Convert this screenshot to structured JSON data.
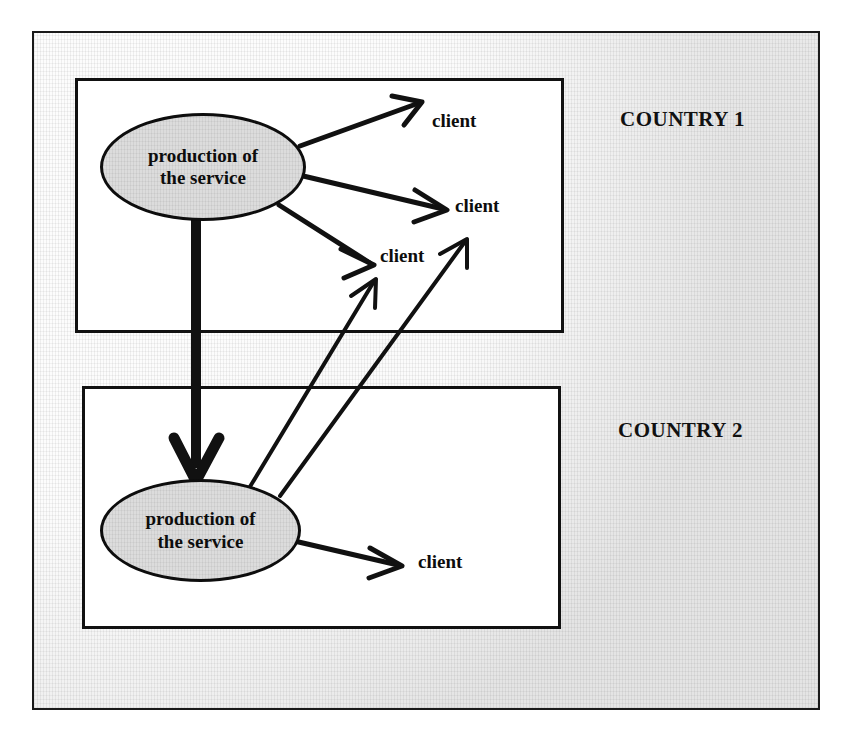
{
  "figure": {
    "background_color": "#ececec",
    "frame_color": "#1a1a1a",
    "node_fill_color": "#dcdcdc",
    "node_stroke_color": "#0d0d0d",
    "edge_color": "#111111"
  },
  "countries": [
    {
      "id": "country-1",
      "label": "COUNTRY 1"
    },
    {
      "id": "country-2",
      "label": "COUNTRY 2"
    }
  ],
  "nodes": [
    {
      "id": "production-1",
      "label": "production of\nthe service",
      "country": "country-1",
      "shape": "ellipse"
    },
    {
      "id": "production-2",
      "label": "production of\nthe service",
      "country": "country-2",
      "shape": "ellipse"
    }
  ],
  "clients": [
    {
      "id": "client-1",
      "label": "client",
      "country": "country-1",
      "served_by": "production-1"
    },
    {
      "id": "client-2",
      "label": "client",
      "country": "country-1",
      "served_by": "production-1"
    },
    {
      "id": "client-3",
      "label": "client",
      "country": "country-1",
      "served_by": "production-1"
    },
    {
      "id": "client-4",
      "label": "client",
      "country": "country-2",
      "served_by": "production-2"
    }
  ],
  "edges": [
    {
      "id": "edge-p1-client-1",
      "from": "production-1",
      "to": "client-1",
      "style": "thin-arrow"
    },
    {
      "id": "edge-p1-client-2",
      "from": "production-1",
      "to": "client-2",
      "style": "thin-arrow"
    },
    {
      "id": "edge-p1-client-3",
      "from": "production-1",
      "to": "client-3",
      "style": "thin-arrow"
    },
    {
      "id": "edge-p1-p2",
      "from": "production-1",
      "to": "production-2",
      "style": "thick-arrow"
    },
    {
      "id": "edge-p2-client-3a",
      "from": "production-2",
      "to": "client-3",
      "style": "thin-arrow-crossborder"
    },
    {
      "id": "edge-p2-client-3b",
      "from": "production-2",
      "to": "client-3",
      "style": "thin-arrow-crossborder"
    },
    {
      "id": "edge-p2-client-4",
      "from": "production-2",
      "to": "client-4",
      "style": "thin-arrow"
    }
  ]
}
